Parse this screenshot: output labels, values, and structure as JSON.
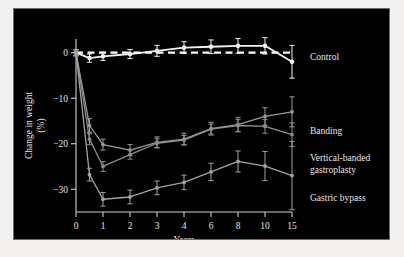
{
  "figure": {
    "background_color": "#000000",
    "border_color": "#6e6e6e",
    "page_color": "#f2f1ef"
  },
  "chart_data": {
    "type": "line",
    "title": "",
    "subtitle": "",
    "xlabel": "Years",
    "ylabel": "Change in weight (%)",
    "xlim": [
      0,
      15
    ],
    "ylim": [
      -35,
      3
    ],
    "xticks": [
      0,
      1,
      2,
      3,
      4,
      6,
      8,
      10,
      15
    ],
    "xticklabels": [
      "0",
      "1",
      "2",
      "3",
      "4",
      "6",
      "8",
      "10",
      "15"
    ],
    "yticks": [
      0,
      -10,
      -20,
      -30
    ],
    "yticklabels": [
      "0",
      "−10",
      "−20",
      "−30"
    ],
    "grid": false,
    "legend_position": "right-outside",
    "reference_line": {
      "y": 0,
      "style": "dashed",
      "color": "#ffffff",
      "label": "zero change"
    },
    "error_bars": "95% confidence interval",
    "series": [
      {
        "name": "Control",
        "color": "#f2f2f2",
        "marker": "circle",
        "x": [
          0,
          0.5,
          1,
          2,
          3,
          4,
          6,
          8,
          10,
          15
        ],
        "values": [
          0.0,
          -1.2,
          -0.8,
          -0.3,
          0.4,
          1.1,
          1.3,
          1.5,
          1.5,
          -2.0
        ],
        "err": [
          0.7,
          0.9,
          0.9,
          1.0,
          1.2,
          1.3,
          1.5,
          1.6,
          1.8,
          3.6
        ]
      },
      {
        "name": "Banding",
        "color": "#9a9a9a",
        "marker": "circle",
        "x": [
          0,
          0.5,
          1,
          2,
          3,
          4,
          6,
          8,
          10,
          15
        ],
        "values": [
          0.0,
          -16.0,
          -20.2,
          -21.4,
          -19.7,
          -19.0,
          -16.7,
          -15.8,
          -14.0,
          -13.0
        ],
        "err": [
          0.6,
          1.5,
          1.2,
          1.2,
          1.2,
          1.3,
          1.4,
          1.6,
          1.9,
          3.3
        ]
      },
      {
        "name": "Vertical-banded gastroplasty",
        "color": "#8d8d8d",
        "marker": "circle",
        "x": [
          0,
          0.5,
          1,
          2,
          3,
          4,
          6,
          8,
          10,
          15
        ],
        "values": [
          0.0,
          -19.0,
          -25.0,
          -22.4,
          -19.9,
          -19.2,
          -16.8,
          -16.0,
          -16.2,
          -18.0
        ],
        "err": [
          0.6,
          1.2,
          1.1,
          1.0,
          1.0,
          1.0,
          1.1,
          1.3,
          1.5,
          2.6
        ]
      },
      {
        "name": "Gastric bypass",
        "color": "#a3a3a3",
        "marker": "circle",
        "x": [
          0,
          0.5,
          1,
          2,
          3,
          4,
          6,
          8,
          10,
          15
        ],
        "values": [
          0.0,
          -26.8,
          -32.2,
          -31.7,
          -29.7,
          -28.5,
          -26.2,
          -23.9,
          -24.9,
          -27.0
        ],
        "err": [
          0.7,
          1.4,
          1.5,
          1.5,
          1.5,
          1.6,
          1.9,
          2.3,
          3.2,
          7.5
        ]
      }
    ]
  },
  "legend": {
    "entries": [
      {
        "label": "Control",
        "color": "#f2f2f2"
      },
      {
        "label": "Banding",
        "color": "#9a9a9a"
      },
      {
        "label": "Vertical-banded",
        "color": "#8d8d8d"
      },
      {
        "label": "gastroplasty",
        "color": "#8d8d8d"
      },
      {
        "label": "Gastric bypass",
        "color": "#a3a3a3"
      }
    ]
  }
}
